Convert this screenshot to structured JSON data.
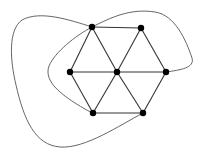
{
  "diagram": {
    "type": "graph",
    "colors": {
      "node": "#000000",
      "edge": "#333333",
      "curve": "#555555",
      "background": "#ffffff"
    },
    "nodes": [
      {
        "id": "top-left",
        "x": 92,
        "y": 27
      },
      {
        "id": "top-right",
        "x": 141,
        "y": 28
      },
      {
        "id": "left",
        "x": 70,
        "y": 72
      },
      {
        "id": "center",
        "x": 117,
        "y": 72
      },
      {
        "id": "right",
        "x": 166,
        "y": 72
      },
      {
        "id": "bottom-left",
        "x": 93,
        "y": 113
      },
      {
        "id": "bottom-right",
        "x": 143,
        "y": 113
      }
    ],
    "straight_edges": [
      [
        "top-left",
        "top-right"
      ],
      [
        "top-right",
        "right"
      ],
      [
        "right",
        "bottom-right"
      ],
      [
        "bottom-right",
        "bottom-left"
      ],
      [
        "bottom-left",
        "left"
      ],
      [
        "left",
        "top-left"
      ],
      [
        "center",
        "top-left"
      ],
      [
        "center",
        "top-right"
      ],
      [
        "center",
        "right"
      ],
      [
        "center",
        "bottom-right"
      ],
      [
        "center",
        "bottom-left"
      ],
      [
        "center",
        "left"
      ]
    ],
    "curved_edges": [
      {
        "from": "top-left",
        "to": "bottom-right",
        "route": "outer loop around left and bottom"
      },
      {
        "from": "right",
        "to": "bottom-left",
        "route": "over the top, then inside loop on the left"
      }
    ]
  }
}
